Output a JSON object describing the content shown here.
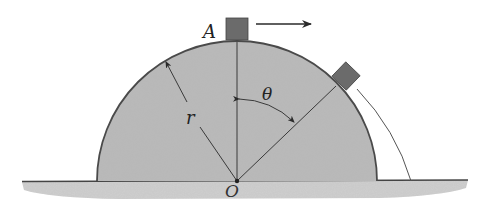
{
  "diagram": {
    "type": "physics-free-body",
    "labels": {
      "point_top": "A",
      "radius": "r",
      "angle": "θ",
      "origin": "O"
    },
    "colors": {
      "hemisphere_fill": "#b9b9b9",
      "hemisphere_stroke": "#4a4a4a",
      "block_fill": "#6b6b6b",
      "ground_fill": "#c8c8c8",
      "line": "#3a3a3a"
    },
    "elements": [
      {
        "name": "hemisphere",
        "shape": "semicircle",
        "center": [
          237,
          181
        ],
        "radius": 140
      },
      {
        "name": "block-at-A",
        "shape": "square",
        "position": "top of hemisphere",
        "velocity_arrow": "right"
      },
      {
        "name": "block-sliding",
        "shape": "square",
        "position": "on surface at angle theta from vertical"
      },
      {
        "name": "trajectory",
        "shape": "curve",
        "description": "path after block leaves surface"
      },
      {
        "name": "ground",
        "shape": "horizontal line with textured fill"
      }
    ]
  }
}
